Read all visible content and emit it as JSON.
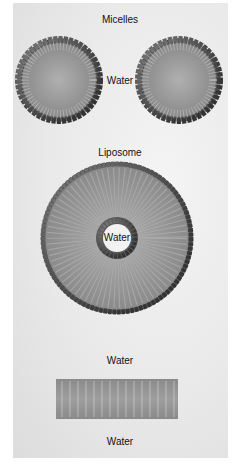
{
  "diagram": {
    "sections": [
      {
        "id": "micelles",
        "title": "Micelles",
        "center_label": "Water",
        "count": 2
      },
      {
        "id": "liposome",
        "title": "Liposome",
        "inner_label": "Water"
      },
      {
        "id": "bilayer",
        "top_label": "Water",
        "bottom_label": "Water"
      }
    ],
    "colors": {
      "head": "#4a4a4a",
      "tail": "#8c8c8c",
      "core": "#a8a8a8",
      "background": "#e8e8e8"
    }
  }
}
